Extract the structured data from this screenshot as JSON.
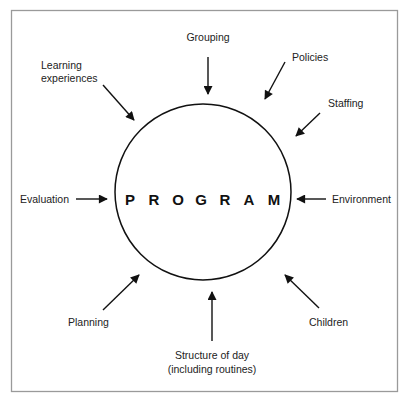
{
  "diagram": {
    "center_label": "PROGRAM",
    "center_letters": [
      "P",
      "R",
      "O",
      "G",
      "R",
      "A",
      "M"
    ],
    "factors": {
      "grouping": "Grouping",
      "policies": "Policies",
      "staffing": "Staffing",
      "environment": "Environment",
      "children": "Children",
      "structure_line1": "Structure of day",
      "structure_line2": "(including routines)",
      "planning": "Planning",
      "evaluation": "Evaluation",
      "learning_line1": "Learning",
      "learning_line2": "experiences"
    },
    "colors": {
      "frame": "#9a9a9a",
      "stroke": "#111111",
      "text": "#222222"
    }
  }
}
